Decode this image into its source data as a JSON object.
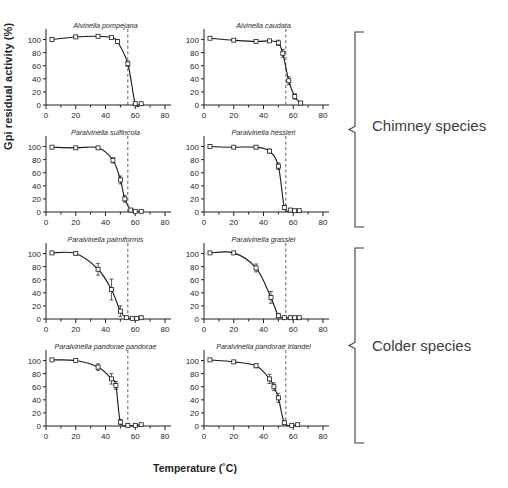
{
  "figure": {
    "ylabel": "Gpi residual activity (%)",
    "xlabel": "Temperature (˚C)",
    "groups": [
      {
        "name": "chimney",
        "label": "Chimney species"
      },
      {
        "name": "colder",
        "label": "Colder species"
      }
    ]
  },
  "chart_data": {
    "type": "line",
    "xlabel": "Temperature (˚C)",
    "ylabel": "Gpi residual activity (%)",
    "xlim": [
      0,
      80
    ],
    "ylim": [
      0,
      110
    ],
    "xticks": [
      0,
      20,
      40,
      60,
      80
    ],
    "yticks": [
      0,
      20,
      40,
      60,
      80,
      100
    ],
    "xminor_step": 10,
    "grid": false,
    "legend": null,
    "marker": "open-square",
    "error_bars": "standard deviation",
    "reference_line": {
      "axis": "x",
      "value": 55,
      "style": "dashed"
    },
    "panels": [
      {
        "row": 1,
        "col": 1,
        "title": "Alvinella pompejana",
        "group": "Chimney species",
        "x": [
          4,
          20,
          35,
          44,
          48,
          55,
          60,
          64
        ],
        "y": [
          100,
          104,
          105,
          103,
          97,
          63,
          2,
          2
        ],
        "yerr": [
          0,
          0,
          0,
          0,
          2,
          4,
          1,
          1
        ]
      },
      {
        "row": 1,
        "col": 2,
        "title": "Alvinella caudata",
        "group": "Chimney species",
        "x": [
          4,
          20,
          35,
          44,
          50,
          53,
          57,
          61,
          65
        ],
        "y": [
          102,
          99,
          97,
          98,
          95,
          79,
          37,
          13,
          3
        ],
        "yerr": [
          0,
          0,
          0,
          0,
          4,
          6,
          6,
          4,
          1
        ]
      },
      {
        "row": 2,
        "col": 1,
        "title": "Paralvinella sulfincola",
        "group": "Chimney species",
        "x": [
          4,
          20,
          35,
          45,
          50,
          53,
          57,
          60,
          64
        ],
        "y": [
          99,
          98,
          98,
          79,
          49,
          20,
          3,
          1,
          1
        ],
        "yerr": [
          0,
          0,
          0,
          4,
          6,
          5,
          2,
          1,
          1
        ]
      },
      {
        "row": 2,
        "col": 2,
        "title": "Paralvinella hessleri",
        "group": "Chimney species",
        "x": [
          4,
          20,
          35,
          44,
          50,
          54,
          58,
          61,
          64
        ],
        "y": [
          100,
          99,
          99,
          93,
          70,
          7,
          3,
          2,
          2
        ],
        "yerr": [
          0,
          0,
          0,
          3,
          5,
          3,
          1,
          1,
          1
        ]
      },
      {
        "row": 3,
        "col": 1,
        "title": "Paralvinella palmiformis",
        "group": "Colder species",
        "x": [
          4,
          20,
          35,
          44,
          50,
          54,
          58,
          61,
          64
        ],
        "y": [
          101,
          100,
          76,
          45,
          12,
          2,
          1,
          1,
          2
        ],
        "yerr": [
          0,
          0,
          9,
          16,
          8,
          2,
          1,
          1,
          1
        ]
      },
      {
        "row": 3,
        "col": 2,
        "title": "Paralvinella grasslei",
        "group": "Colder species",
        "x": [
          4,
          20,
          35,
          45,
          50,
          54,
          58,
          61,
          64
        ],
        "y": [
          101,
          101,
          78,
          33,
          5,
          2,
          2,
          2,
          2
        ],
        "yerr": [
          0,
          0,
          6,
          9,
          3,
          1,
          1,
          1,
          1
        ]
      },
      {
        "row": 4,
        "col": 1,
        "title": "Paralvinella pandorae pandorae",
        "group": "Colder species",
        "x": [
          4,
          20,
          35,
          44,
          47,
          50,
          55,
          60,
          64
        ],
        "y": [
          101,
          100,
          90,
          72,
          62,
          6,
          1,
          1,
          2
        ],
        "yerr": [
          0,
          0,
          5,
          8,
          6,
          4,
          1,
          1,
          1
        ]
      },
      {
        "row": 4,
        "col": 2,
        "title": "Paralvinella pandorae irlandei",
        "group": "Colder species",
        "x": [
          4,
          20,
          35,
          44,
          47,
          50,
          54,
          59,
          63
        ],
        "y": [
          101,
          98,
          92,
          72,
          60,
          43,
          5,
          1,
          2
        ],
        "yerr": [
          0,
          0,
          3,
          7,
          6,
          7,
          3,
          1,
          1
        ]
      }
    ]
  }
}
